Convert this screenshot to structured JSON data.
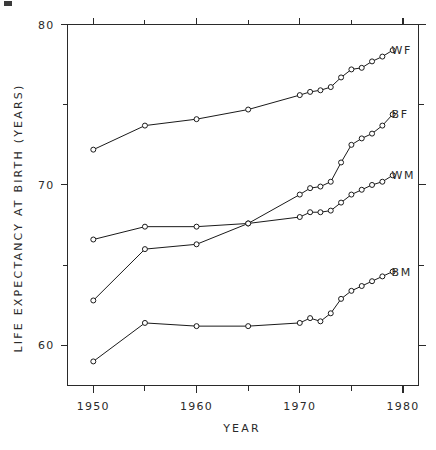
{
  "chart_data": {
    "type": "line",
    "title": "",
    "subtitle": "",
    "xlabel": "YEAR",
    "ylabel": "LIFE EXPECTANCY AT BIRTH (YEARS)",
    "xlim": [
      1947.5,
      1981.5
    ],
    "ylim": [
      57.5,
      80.0
    ],
    "grid": false,
    "legend_position": "right-inline-labels",
    "x_ticks_major": [
      1950,
      1960,
      1970,
      1980
    ],
    "x_tick_labels": [
      "1950",
      "1960",
      "1970",
      "1980"
    ],
    "x_ticks_minor": [
      1955,
      1965,
      1975
    ],
    "y_ticks_major": [
      60,
      70,
      80
    ],
    "y_tick_labels": [
      "60",
      "70",
      "80"
    ],
    "y_ticks_minor": [
      65,
      75
    ],
    "series": [
      {
        "name": "WF",
        "label": "WF",
        "marker": "open-circle",
        "x": [
          1950,
          1955,
          1960,
          1965,
          1970,
          1971,
          1972,
          1973,
          1974,
          1975,
          1976,
          1977,
          1978,
          1979
        ],
        "values": [
          72.2,
          73.7,
          74.1,
          74.7,
          75.6,
          75.8,
          75.9,
          76.1,
          76.7,
          77.2,
          77.3,
          77.7,
          78.0,
          78.4
        ]
      },
      {
        "name": "BF",
        "label": "BF",
        "marker": "open-circle",
        "x": [
          1950,
          1955,
          1960,
          1965,
          1970,
          1971,
          1972,
          1973,
          1974,
          1975,
          1976,
          1977,
          1978,
          1979
        ],
        "values": [
          62.8,
          66.0,
          66.3,
          67.6,
          69.4,
          69.8,
          69.9,
          70.2,
          71.4,
          72.5,
          72.9,
          73.2,
          73.7,
          74.4
        ]
      },
      {
        "name": "WM",
        "label": "WM",
        "marker": "open-circle",
        "x": [
          1950,
          1955,
          1960,
          1965,
          1970,
          1971,
          1972,
          1973,
          1974,
          1975,
          1976,
          1977,
          1978,
          1979
        ],
        "values": [
          66.6,
          67.4,
          67.4,
          67.6,
          68.0,
          68.3,
          68.3,
          68.4,
          68.9,
          69.4,
          69.7,
          70.0,
          70.2,
          70.6
        ]
      },
      {
        "name": "BM",
        "label": "BM",
        "marker": "open-circle",
        "x": [
          1950,
          1955,
          1960,
          1965,
          1970,
          1971,
          1972,
          1973,
          1974,
          1975,
          1976,
          1977,
          1978,
          1979
        ],
        "values": [
          59.0,
          61.4,
          61.2,
          61.2,
          61.4,
          61.7,
          61.5,
          62.0,
          62.9,
          63.4,
          63.7,
          64.0,
          64.3,
          64.6
        ]
      }
    ],
    "series_label_positions": [
      {
        "name": "WF",
        "value": 78.4
      },
      {
        "name": "BF",
        "value": 74.4
      },
      {
        "name": "WM",
        "value": 70.6
      },
      {
        "name": "BM",
        "value": 64.6
      }
    ]
  },
  "colors": {
    "background": "#ffffff",
    "axis": "#2a2a2a",
    "line": "#1a1a1a",
    "marker_fill": "#ffffff",
    "text": "#2a2a2a"
  }
}
